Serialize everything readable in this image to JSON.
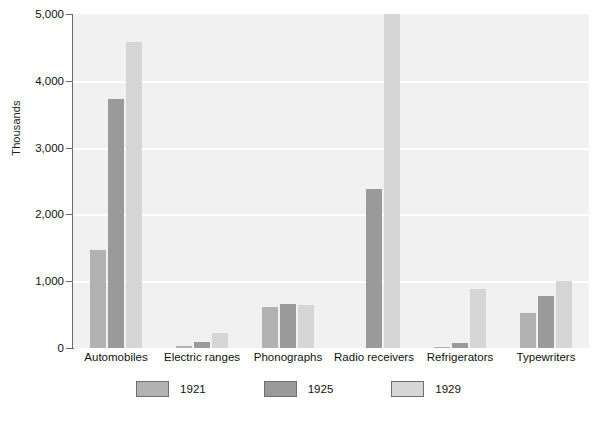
{
  "chart_data": {
    "type": "bar",
    "title": "",
    "subtitle": "",
    "xlabel": "",
    "ylabel": "Thousands",
    "ylim": [
      0,
      5000
    ],
    "yticks": [
      0,
      1000,
      2000,
      3000,
      4000,
      5000
    ],
    "ytick_labels": [
      "0",
      "1,000",
      "2,000",
      "3,000",
      "4,000",
      "5,000"
    ],
    "grid": true,
    "legend_position": "bottom",
    "categories": [
      "Automobiles",
      "Electric ranges",
      "Phonographs",
      "Radio receivers",
      "Refrigerators",
      "Typewriters"
    ],
    "series": [
      {
        "name": "1921",
        "color": "#b2b2b2",
        "values": [
          1468,
          30,
          620,
          0,
          5,
          530
        ]
      },
      {
        "name": "1925",
        "color": "#9a9a9a",
        "values": [
          3735,
          90,
          657,
          2375,
          75,
          780
        ]
      },
      {
        "name": "1929",
        "color": "#d6d6d6",
        "values": [
          4587,
          231,
          640,
          5000,
          890,
          1010
        ]
      }
    ]
  },
  "legend": {
    "items": [
      {
        "label": "1921",
        "color": "#b2b2b2"
      },
      {
        "label": "1925",
        "color": "#9a9a9a"
      },
      {
        "label": "1929",
        "color": "#d6d6d6"
      }
    ]
  },
  "colors": {
    "plot_background": "#f1f1f1",
    "page_background": "#ffffff",
    "gridline": "#ffffff",
    "axis": "#6a6a6a",
    "text": "#111111"
  }
}
